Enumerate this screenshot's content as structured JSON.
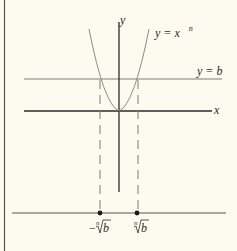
{
  "diagram": {
    "axes": {
      "y_label": "y",
      "x_label": "x"
    },
    "curve": {
      "label_main": "y = x",
      "label_exponent": "n"
    },
    "horizontal_line": {
      "label": "y = b"
    },
    "number_line": {
      "points": [
        {
          "label_radical_prefix": "−",
          "label_index": "n",
          "label_radicand": "b"
        },
        {
          "label_radical_prefix": "",
          "label_index": "n",
          "label_radicand": "b"
        }
      ]
    },
    "colors": {
      "background": "#fdfbf0",
      "ink": "#2a2a2a",
      "curve": "#8a8a8a",
      "thin_line": "#7a7a7a"
    }
  }
}
